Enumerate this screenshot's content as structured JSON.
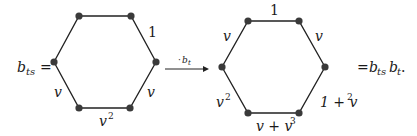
{
  "left_expression": {
    "lhs_base": "b",
    "lhs_sub": "ts",
    "equals": "="
  },
  "left_hexagon": {
    "edge_labels": {
      "top_right": "1",
      "bottom_right": "v",
      "bottom": "v",
      "bottom_sup": "2",
      "bottom_left": "v"
    }
  },
  "arrow": {
    "label_prefix": "·",
    "label_base": "b",
    "label_sub": "t"
  },
  "right_hexagon": {
    "edge_labels": {
      "top": "1",
      "top_left": "v",
      "top_right": "v",
      "bottom_left": "v",
      "bottom_left_sup": "2",
      "bottom_right_prefix": "1 + v",
      "bottom_right_sup": "2",
      "bottom_prefix": "v + v",
      "bottom_sup": "3"
    }
  },
  "right_expression": {
    "equals": "=",
    "rhs_base1": "b",
    "rhs_sub1": "ts",
    "rhs_base2": "b",
    "rhs_sub2": "t",
    "period": "."
  },
  "colors": {
    "edge": "#222222",
    "vertex": "#3a3a3a",
    "text": "#1a1a1a",
    "background": "#ffffff"
  }
}
